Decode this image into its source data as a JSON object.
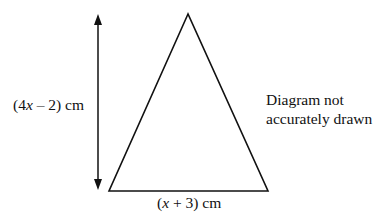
{
  "diagram": {
    "type": "isosceles-triangle",
    "labels": {
      "height": {
        "prefix": "(4",
        "var": "x",
        "suffix": " – 2) cm",
        "full": "(4x – 2) cm"
      },
      "base": {
        "prefix": "(",
        "var": "x",
        "suffix": " + 3) cm",
        "full": "(x + 3) cm"
      }
    },
    "note": {
      "line1": "Diagram not",
      "line2": "accurately drawn"
    },
    "geometry": {
      "apex": [
        188,
        14
      ],
      "base_left": [
        109,
        191
      ],
      "base_right": [
        268,
        191
      ],
      "height_arrow": {
        "x": 98,
        "y_top": 14,
        "y_bottom": 190
      }
    },
    "colors": {
      "stroke": "#111111",
      "background": "#ffffff"
    }
  }
}
